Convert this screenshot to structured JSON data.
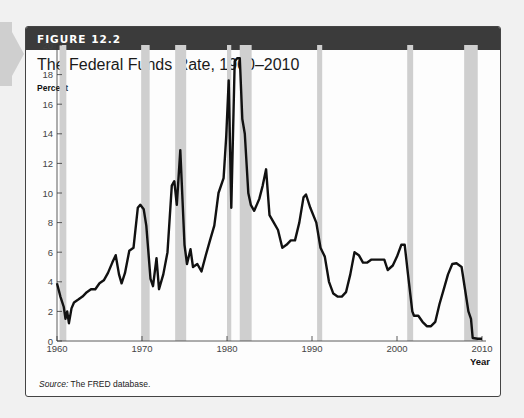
{
  "figure": {
    "label": "FIGURE 12.2",
    "title": "The Federal Funds Rate, 1960–2010",
    "source_prefix": "Source:",
    "source_text": " The FRED database."
  },
  "colors": {
    "header_bg": "#3b3b3b",
    "line": "#111111",
    "recession": "#cfcfcf",
    "background": "#f1f1f1"
  },
  "chart_data": {
    "type": "line",
    "title": "The Federal Funds Rate, 1960–2010",
    "xlabel": "Year",
    "ylabel": "Percent",
    "xlim": [
      1960,
      2010
    ],
    "ylim": [
      0,
      20
    ],
    "x_ticks": [
      1960,
      1970,
      1980,
      1990,
      2000,
      2010
    ],
    "y_ticks": [
      0,
      2,
      4,
      6,
      8,
      10,
      12,
      14,
      16,
      18,
      20
    ],
    "grid": false,
    "legend": null,
    "shaded_regions_label": "Recessions",
    "recessions": [
      [
        1960.3,
        1961.1
      ],
      [
        1969.9,
        1970.9
      ],
      [
        1973.9,
        1975.2
      ],
      [
        1980.0,
        1980.5
      ],
      [
        1981.5,
        1982.9
      ],
      [
        1990.6,
        1991.2
      ],
      [
        2001.2,
        2001.9
      ],
      [
        2007.9,
        2009.5
      ]
    ],
    "series": [
      {
        "name": "Federal Funds Rate",
        "points": [
          [
            1960.0,
            3.9
          ],
          [
            1960.4,
            3.0
          ],
          [
            1960.8,
            2.3
          ],
          [
            1961.0,
            1.5
          ],
          [
            1961.2,
            2.0
          ],
          [
            1961.4,
            1.2
          ],
          [
            1961.7,
            2.2
          ],
          [
            1962.0,
            2.6
          ],
          [
            1962.5,
            2.8
          ],
          [
            1963.0,
            3.0
          ],
          [
            1963.5,
            3.3
          ],
          [
            1964.0,
            3.5
          ],
          [
            1964.5,
            3.5
          ],
          [
            1965.0,
            3.9
          ],
          [
            1965.5,
            4.1
          ],
          [
            1966.0,
            4.6
          ],
          [
            1966.5,
            5.3
          ],
          [
            1966.9,
            5.8
          ],
          [
            1967.3,
            4.5
          ],
          [
            1967.6,
            3.9
          ],
          [
            1968.0,
            4.6
          ],
          [
            1968.5,
            6.1
          ],
          [
            1969.0,
            6.3
          ],
          [
            1969.5,
            9.0
          ],
          [
            1969.8,
            9.2
          ],
          [
            1970.2,
            8.9
          ],
          [
            1970.5,
            7.8
          ],
          [
            1971.0,
            4.2
          ],
          [
            1971.3,
            3.7
          ],
          [
            1971.7,
            5.6
          ],
          [
            1972.0,
            3.5
          ],
          [
            1972.5,
            4.5
          ],
          [
            1973.0,
            6.0
          ],
          [
            1973.5,
            10.5
          ],
          [
            1973.8,
            10.8
          ],
          [
            1974.1,
            9.2
          ],
          [
            1974.5,
            12.9
          ],
          [
            1975.0,
            6.5
          ],
          [
            1975.3,
            5.2
          ],
          [
            1975.7,
            6.2
          ],
          [
            1976.0,
            5.0
          ],
          [
            1976.5,
            5.2
          ],
          [
            1977.0,
            4.7
          ],
          [
            1977.5,
            5.8
          ],
          [
            1978.0,
            6.8
          ],
          [
            1978.5,
            7.8
          ],
          [
            1979.0,
            10.0
          ],
          [
            1979.6,
            11.0
          ],
          [
            1979.9,
            13.8
          ],
          [
            1980.2,
            17.6
          ],
          [
            1980.5,
            9.0
          ],
          [
            1980.9,
            18.9
          ],
          [
            1981.2,
            19.1
          ],
          [
            1981.5,
            19.1
          ],
          [
            1981.8,
            15.0
          ],
          [
            1982.1,
            14.0
          ],
          [
            1982.5,
            10.0
          ],
          [
            1982.8,
            9.2
          ],
          [
            1983.2,
            8.8
          ],
          [
            1983.8,
            9.6
          ],
          [
            1984.2,
            10.5
          ],
          [
            1984.6,
            11.6
          ],
          [
            1985.0,
            8.5
          ],
          [
            1985.5,
            8.0
          ],
          [
            1986.0,
            7.5
          ],
          [
            1986.5,
            6.3
          ],
          [
            1987.0,
            6.5
          ],
          [
            1987.5,
            6.8
          ],
          [
            1988.0,
            6.8
          ],
          [
            1988.5,
            8.0
          ],
          [
            1989.0,
            9.7
          ],
          [
            1989.3,
            9.9
          ],
          [
            1989.8,
            9.0
          ],
          [
            1990.5,
            8.0
          ],
          [
            1991.0,
            6.3
          ],
          [
            1991.5,
            5.7
          ],
          [
            1992.0,
            4.0
          ],
          [
            1992.5,
            3.2
          ],
          [
            1993.0,
            3.0
          ],
          [
            1993.5,
            3.0
          ],
          [
            1994.0,
            3.3
          ],
          [
            1994.5,
            4.5
          ],
          [
            1995.0,
            6.0
          ],
          [
            1995.5,
            5.8
          ],
          [
            1996.0,
            5.3
          ],
          [
            1996.5,
            5.3
          ],
          [
            1997.0,
            5.5
          ],
          [
            1997.5,
            5.5
          ],
          [
            1998.0,
            5.5
          ],
          [
            1998.5,
            5.5
          ],
          [
            1998.9,
            4.8
          ],
          [
            1999.5,
            5.1
          ],
          [
            2000.0,
            5.7
          ],
          [
            2000.5,
            6.5
          ],
          [
            2000.9,
            6.5
          ],
          [
            2001.3,
            4.5
          ],
          [
            2001.8,
            2.0
          ],
          [
            2002.0,
            1.7
          ],
          [
            2002.5,
            1.7
          ],
          [
            2003.0,
            1.3
          ],
          [
            2003.5,
            1.0
          ],
          [
            2004.0,
            1.0
          ],
          [
            2004.5,
            1.3
          ],
          [
            2005.0,
            2.5
          ],
          [
            2005.5,
            3.5
          ],
          [
            2006.0,
            4.5
          ],
          [
            2006.5,
            5.2
          ],
          [
            2007.0,
            5.25
          ],
          [
            2007.6,
            5.0
          ],
          [
            2008.0,
            3.5
          ],
          [
            2008.4,
            2.0
          ],
          [
            2008.7,
            1.5
          ],
          [
            2008.9,
            0.2
          ],
          [
            2009.5,
            0.15
          ],
          [
            2010.0,
            0.15
          ]
        ]
      }
    ]
  }
}
